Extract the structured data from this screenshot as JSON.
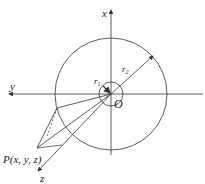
{
  "diagram": {
    "labels": {
      "x_axis": "x",
      "y_axis": "y",
      "z_axis": "z",
      "origin": "O",
      "r1": "r",
      "r1_sub": "1",
      "r2": "r",
      "r2_sub": "2",
      "point": "P(x, y, z)"
    },
    "geometry": {
      "origin": [
        111,
        94
      ],
      "outer_radius": 56,
      "inner_radius": 12,
      "point_P": [
        37,
        148
      ],
      "projection_point": [
        57,
        108
      ],
      "z_axis_end": [
        38,
        170
      ]
    },
    "colors": {
      "stroke": "#333333",
      "background": "#ffffff"
    }
  }
}
